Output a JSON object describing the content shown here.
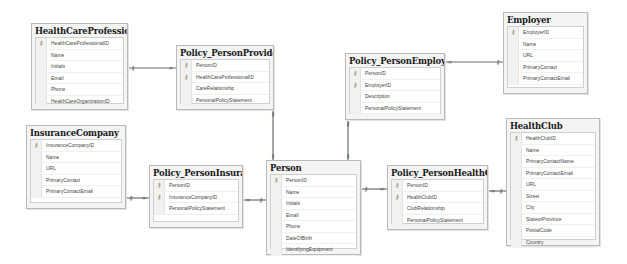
{
  "diagram": {
    "tables": [
      {
        "id": "HealthCareProfessional",
        "title": "HealthCareProfessional",
        "x": 31,
        "y": 23,
        "w": 97,
        "h": 87,
        "columns": [
          {
            "name": "HealthCareProfessionalID",
            "pk": true
          },
          {
            "name": "Name",
            "pk": false
          },
          {
            "name": "Initials",
            "pk": false
          },
          {
            "name": "Email",
            "pk": false
          },
          {
            "name": "Phone",
            "pk": false
          },
          {
            "name": "HealthCareOrganizationID",
            "pk": false
          }
        ]
      },
      {
        "id": "Policy_PersonProvider",
        "title": "Policy_PersonProvider",
        "x": 176,
        "y": 45,
        "w": 98,
        "h": 65,
        "columns": [
          {
            "name": "PersonID",
            "pk": true
          },
          {
            "name": "HealthCareProfessionalID",
            "pk": true
          },
          {
            "name": "CareRelationship",
            "pk": false
          },
          {
            "name": "PersonalPolicyStatement",
            "pk": false
          }
        ]
      },
      {
        "id": "Policy_PersonEmployer",
        "title": "Policy_PersonEmployer",
        "x": 345,
        "y": 53,
        "w": 100,
        "h": 67,
        "columns": [
          {
            "name": "PersonID",
            "pk": true
          },
          {
            "name": "EmployerID",
            "pk": true
          },
          {
            "name": "Description",
            "pk": false
          },
          {
            "name": "PersonalPolicyStatement",
            "pk": false
          }
        ]
      },
      {
        "id": "Employer",
        "title": "Employer",
        "x": 503,
        "y": 12,
        "w": 85,
        "h": 82,
        "columns": [
          {
            "name": "EmployerID",
            "pk": true
          },
          {
            "name": "Name",
            "pk": false
          },
          {
            "name": "URL",
            "pk": false
          },
          {
            "name": "PrimaryContact",
            "pk": false
          },
          {
            "name": "PrimaryContactEmail",
            "pk": false
          }
        ]
      },
      {
        "id": "InsuranceCompany",
        "title": "InsuranceCompany",
        "x": 26,
        "y": 125,
        "w": 100,
        "h": 84,
        "columns": [
          {
            "name": "InsuranceCompanyID",
            "pk": true
          },
          {
            "name": "Name",
            "pk": false
          },
          {
            "name": "URL",
            "pk": false
          },
          {
            "name": "PrimaryContact",
            "pk": false
          },
          {
            "name": "PrimaryContactEmail",
            "pk": false
          }
        ]
      },
      {
        "id": "Policy_PersonInsurance",
        "title": "Policy_PersonInsurance",
        "x": 149,
        "y": 165,
        "w": 94,
        "h": 63,
        "columns": [
          {
            "name": "PersonID",
            "pk": true
          },
          {
            "name": "InsuranceCompanyID",
            "pk": true
          },
          {
            "name": "PersonalPolicyStatement",
            "pk": false
          }
        ]
      },
      {
        "id": "Person",
        "title": "Person",
        "x": 266,
        "y": 160,
        "w": 95,
        "h": 95,
        "columns": [
          {
            "name": "PersonID",
            "pk": true
          },
          {
            "name": "Name",
            "pk": false
          },
          {
            "name": "Initials",
            "pk": false
          },
          {
            "name": "Email",
            "pk": false
          },
          {
            "name": "Phone",
            "pk": false
          },
          {
            "name": "DateOfBirth",
            "pk": false
          },
          {
            "name": "IdentifyingEquipment",
            "pk": false
          }
        ]
      },
      {
        "id": "Policy_PersonHealthClub",
        "title": "Policy_PersonHealthClub",
        "x": 387,
        "y": 165,
        "w": 101,
        "h": 65,
        "columns": [
          {
            "name": "PersonID",
            "pk": true
          },
          {
            "name": "HealthClubID",
            "pk": true
          },
          {
            "name": "ClubRelationship",
            "pk": false
          },
          {
            "name": "PersonalPolicyStatement",
            "pk": false
          }
        ]
      },
      {
        "id": "HealthClub",
        "title": "HealthClub",
        "x": 506,
        "y": 118,
        "w": 94,
        "h": 128,
        "columns": [
          {
            "name": "HealthClubID",
            "pk": true
          },
          {
            "name": "Name",
            "pk": false
          },
          {
            "name": "PrimaryContactName",
            "pk": false
          },
          {
            "name": "PrimaryContactEmail",
            "pk": false
          },
          {
            "name": "URL",
            "pk": false
          },
          {
            "name": "Street",
            "pk": false
          },
          {
            "name": "City",
            "pk": false
          },
          {
            "name": "StateorProvince",
            "pk": false
          },
          {
            "name": "PostalCode",
            "pk": false
          },
          {
            "name": "Country",
            "pk": false
          }
        ]
      }
    ],
    "relationships": [
      {
        "from": "Policy_PersonProvider",
        "to": "HealthCareProfessional",
        "points": [
          [
            176,
            68
          ],
          [
            128,
            68
          ]
        ],
        "many_end": "from"
      },
      {
        "from": "Policy_PersonProvider",
        "to": "Person",
        "points": [
          [
            273,
            110
          ],
          [
            273,
            160
          ]
        ],
        "many_end": "none"
      },
      {
        "from": "Policy_PersonEmployer",
        "to": "Employer",
        "points": [
          [
            445,
            62
          ],
          [
            503,
            62
          ]
        ],
        "many_end": "from"
      },
      {
        "from": "Policy_PersonEmployer",
        "to": "Person",
        "points": [
          [
            348,
            120
          ],
          [
            348,
            160
          ]
        ],
        "many_end": "none"
      },
      {
        "from": "Policy_PersonInsurance",
        "to": "InsuranceCompany",
        "points": [
          [
            149,
            198
          ],
          [
            126,
            198
          ]
        ],
        "many_end": "from"
      },
      {
        "from": "Policy_PersonInsurance",
        "to": "Person",
        "points": [
          [
            243,
            200
          ],
          [
            266,
            200
          ]
        ],
        "many_end": "from"
      },
      {
        "from": "Policy_PersonHealthClub",
        "to": "Person",
        "points": [
          [
            387,
            189
          ],
          [
            361,
            189
          ]
        ],
        "many_end": "from"
      },
      {
        "from": "Policy_PersonHealthClub",
        "to": "HealthClub",
        "points": [
          [
            488,
            191
          ],
          [
            506,
            191
          ]
        ],
        "many_end": "from"
      }
    ],
    "colors": {
      "line": "#6f6f6f",
      "box_bg": "#f4f4f4",
      "box_border": "#b9b9b9",
      "title_text": "#1a1a1a",
      "key_icon": "#8a7a3a"
    }
  }
}
